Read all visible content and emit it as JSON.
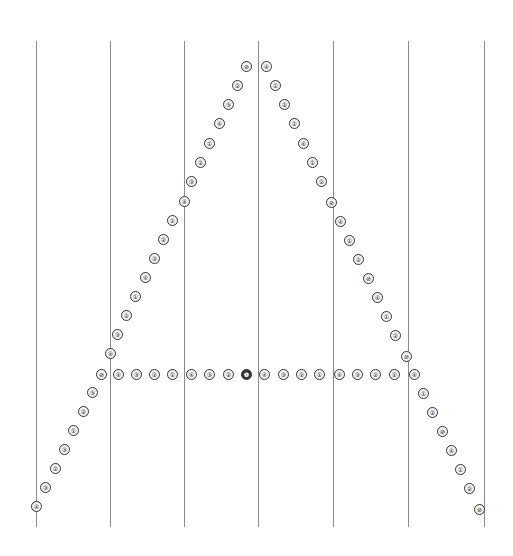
{
  "diagram": {
    "guide_lines": {
      "x": [
        36,
        110,
        184,
        258,
        333,
        408,
        484
      ],
      "top": 41,
      "bottom": 527,
      "color": "#8a8a8a"
    },
    "dot_style": {
      "outline": "#333333",
      "fill": "#f4f4f4",
      "diameter": 9
    },
    "left_stroke": [
      {
        "x": 246,
        "y": 66,
        "g": "⊘"
      },
      {
        "x": 237,
        "y": 85,
        "g": "②"
      },
      {
        "x": 228,
        "y": 104,
        "g": "③"
      },
      {
        "x": 219,
        "y": 123,
        "g": "④"
      },
      {
        "x": 209,
        "y": 143,
        "g": "①"
      },
      {
        "x": 200,
        "y": 162,
        "g": "②"
      },
      {
        "x": 191,
        "y": 181,
        "g": "③"
      },
      {
        "x": 184,
        "y": 201,
        "g": "④"
      },
      {
        "x": 172,
        "y": 220,
        "g": "①"
      },
      {
        "x": 163,
        "y": 239,
        "g": "②"
      },
      {
        "x": 154,
        "y": 258,
        "g": "③"
      },
      {
        "x": 145,
        "y": 277,
        "g": "④"
      },
      {
        "x": 135,
        "y": 296,
        "g": "①"
      },
      {
        "x": 126,
        "y": 315,
        "g": "②"
      },
      {
        "x": 117,
        "y": 334,
        "g": "③"
      },
      {
        "x": 110,
        "y": 353,
        "g": "④"
      },
      {
        "x": 101,
        "y": 374,
        "g": "⊘"
      },
      {
        "x": 92,
        "y": 392,
        "g": "③"
      },
      {
        "x": 83,
        "y": 411,
        "g": "②"
      },
      {
        "x": 73,
        "y": 430,
        "g": "①"
      },
      {
        "x": 64,
        "y": 449,
        "g": "③"
      },
      {
        "x": 55,
        "y": 468,
        "g": "②"
      },
      {
        "x": 45,
        "y": 487,
        "g": "③"
      },
      {
        "x": 36,
        "y": 506,
        "g": "④"
      }
    ],
    "right_stroke": [
      {
        "x": 266,
        "y": 66,
        "g": "④"
      },
      {
        "x": 275,
        "y": 85,
        "g": "①"
      },
      {
        "x": 284,
        "y": 104,
        "g": "②"
      },
      {
        "x": 294,
        "y": 123,
        "g": "①"
      },
      {
        "x": 303,
        "y": 143,
        "g": "④"
      },
      {
        "x": 312,
        "y": 162,
        "g": "①"
      },
      {
        "x": 321,
        "y": 181,
        "g": "②"
      },
      {
        "x": 331,
        "y": 202,
        "g": "⊘"
      },
      {
        "x": 340,
        "y": 221,
        "g": "④"
      },
      {
        "x": 349,
        "y": 240,
        "g": "①"
      },
      {
        "x": 358,
        "y": 259,
        "g": "②"
      },
      {
        "x": 368,
        "y": 278,
        "g": "⊘"
      },
      {
        "x": 377,
        "y": 297,
        "g": "④"
      },
      {
        "x": 386,
        "y": 316,
        "g": "①"
      },
      {
        "x": 395,
        "y": 335,
        "g": "②"
      },
      {
        "x": 406,
        "y": 356,
        "g": "⊘"
      },
      {
        "x": 414,
        "y": 374,
        "g": "④"
      },
      {
        "x": 423,
        "y": 393,
        "g": "①"
      },
      {
        "x": 432,
        "y": 412,
        "g": "②"
      },
      {
        "x": 442,
        "y": 431,
        "g": "⊘"
      },
      {
        "x": 451,
        "y": 450,
        "g": "④"
      },
      {
        "x": 460,
        "y": 469,
        "g": "①"
      },
      {
        "x": 469,
        "y": 488,
        "g": "②"
      },
      {
        "x": 479,
        "y": 509,
        "g": "⊘"
      }
    ],
    "crossbar": [
      {
        "x": 118,
        "y": 374,
        "g": "④"
      },
      {
        "x": 136,
        "y": 374,
        "g": "③"
      },
      {
        "x": 154,
        "y": 374,
        "g": "②"
      },
      {
        "x": 172,
        "y": 374,
        "g": "①"
      },
      {
        "x": 191,
        "y": 374,
        "g": "④"
      },
      {
        "x": 209,
        "y": 374,
        "g": "③"
      },
      {
        "x": 228,
        "y": 374,
        "g": "②"
      },
      {
        "x": 246,
        "y": 374,
        "g": "❶",
        "bold": true
      },
      {
        "x": 264,
        "y": 374,
        "g": "④"
      },
      {
        "x": 283,
        "y": 374,
        "g": "③"
      },
      {
        "x": 301,
        "y": 374,
        "g": "②"
      },
      {
        "x": 319,
        "y": 374,
        "g": "①"
      },
      {
        "x": 339,
        "y": 374,
        "g": "④"
      },
      {
        "x": 357,
        "y": 374,
        "g": "③"
      },
      {
        "x": 375,
        "y": 374,
        "g": "②"
      },
      {
        "x": 394,
        "y": 374,
        "g": "①"
      }
    ]
  }
}
